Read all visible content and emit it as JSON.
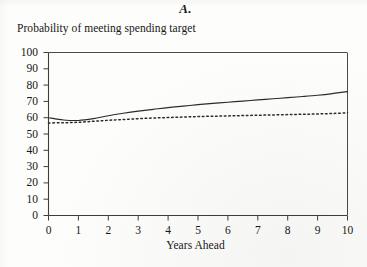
{
  "panel": {
    "title": "A."
  },
  "axes": {
    "y_title": "Probability of meeting spending target",
    "x_title": "Years Ahead",
    "y_ticks": [
      "0",
      "10",
      "20",
      "30",
      "40",
      "50",
      "60",
      "70",
      "80",
      "90",
      "100"
    ],
    "x_ticks": [
      "0",
      "1",
      "2",
      "3",
      "4",
      "5",
      "6",
      "7",
      "8",
      "9",
      "10"
    ]
  },
  "colors": {
    "ink": "#171717",
    "axis": "#4a4a4a",
    "line": "#2b2b2b",
    "paper": "#fdfdfc"
  },
  "chart_data": {
    "type": "line",
    "title": "A.",
    "subtitle": "Probability of meeting spending target",
    "xlabel": "Years Ahead",
    "ylabel": "Probability of meeting spending target",
    "xlim": [
      0,
      10
    ],
    "ylim": [
      0,
      100
    ],
    "xticks": [
      0,
      1,
      2,
      3,
      4,
      5,
      6,
      7,
      8,
      9,
      10
    ],
    "yticks": [
      0,
      10,
      20,
      30,
      40,
      50,
      60,
      70,
      80,
      90,
      100
    ],
    "grid": false,
    "legend": "none",
    "x": [
      0,
      0.5,
      1,
      1.5,
      2,
      2.5,
      3,
      3.5,
      4,
      4.5,
      5,
      5.5,
      6,
      6.5,
      7,
      7.5,
      8,
      8.5,
      9,
      9.5,
      10
    ],
    "series": [
      {
        "name": "solid",
        "style": "solid",
        "values": [
          60.0,
          58.6,
          58.3,
          59.4,
          61.2,
          62.7,
          64.0,
          65.1,
          66.2,
          67.1,
          68.0,
          68.8,
          69.5,
          70.2,
          70.9,
          71.6,
          72.3,
          73.0,
          73.8,
          74.8,
          76.0
        ]
      },
      {
        "name": "dotted",
        "style": "dotted",
        "values": [
          56.8,
          56.9,
          57.2,
          57.8,
          58.4,
          58.9,
          59.4,
          59.8,
          60.1,
          60.4,
          60.7,
          60.9,
          61.1,
          61.3,
          61.5,
          61.7,
          61.9,
          62.1,
          62.3,
          62.6,
          63.0
        ]
      }
    ]
  }
}
